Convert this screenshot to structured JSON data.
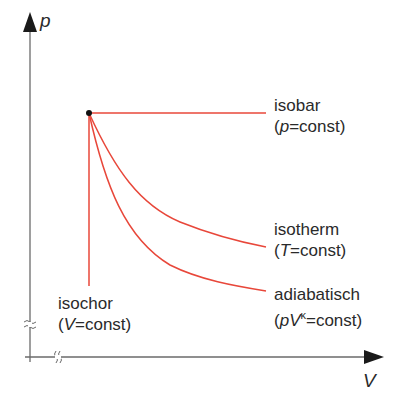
{
  "diagram": {
    "type": "p-V diagram of thermodynamic state changes",
    "axes": {
      "y_label": "p",
      "x_label": "V",
      "y_axis_break": "≈",
      "x_axis_break": "≈"
    },
    "start_point": {
      "x": 89,
      "y": 113
    },
    "curve_color": "#e8473a",
    "curves": [
      {
        "name": "isobar",
        "condition_var": "p",
        "condition_rest": "=const",
        "shape": "horizontal line"
      },
      {
        "name": "isotherm",
        "condition_var": "T",
        "condition_rest": "=const",
        "shape": "hyperbola pV=const"
      },
      {
        "name": "adiabatisch",
        "condition_var": "pV",
        "condition_exp": "κ",
        "condition_rest": "=const",
        "shape": "steeper curve pV^κ=const"
      },
      {
        "name": "isochor",
        "condition_var": "V",
        "condition_rest": "=const",
        "shape": "vertical line"
      }
    ]
  },
  "labels": {
    "isobar": {
      "line1": "isobar",
      "open": "(",
      "var": "p",
      "rest": "=const)"
    },
    "isotherm": {
      "line1": "isotherm",
      "open": "(",
      "var": "T",
      "rest": "=const)"
    },
    "adiabatisch": {
      "line1": "adiabatisch",
      "open": "(",
      "var": "pV",
      "exp": "κ",
      "rest": "=const)"
    },
    "isochor": {
      "line1": "isochor",
      "open": "(",
      "var": "V",
      "rest": "=const)"
    }
  },
  "axis_labels": {
    "p": "p",
    "V": "V"
  }
}
